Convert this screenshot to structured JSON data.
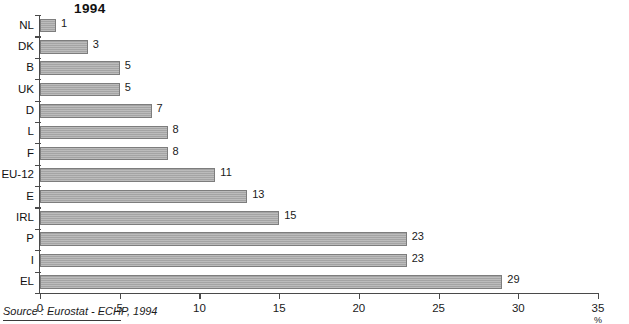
{
  "chart_data": {
    "type": "bar",
    "orientation": "horizontal",
    "title": "1994",
    "xlabel": "%",
    "ylabel": "",
    "xlim": [
      0,
      35
    ],
    "xticks": [
      0,
      5,
      10,
      15,
      20,
      25,
      30,
      35
    ],
    "grid": false,
    "legend": null,
    "categories": [
      "NL",
      "DK",
      "B",
      "UK",
      "D",
      "L",
      "F",
      "EU-12",
      "E",
      "IRL",
      "P",
      "I",
      "EL"
    ],
    "values": [
      1,
      3,
      5,
      5,
      7,
      8,
      8,
      11,
      13,
      15,
      23,
      23,
      29
    ],
    "data_labels": [
      "1",
      "3",
      "5",
      "5",
      "7",
      "8",
      "8",
      "11",
      "13",
      "15",
      "23",
      "23",
      "29"
    ],
    "source": "Source : Eurostat - ECHP, 1994",
    "bar_color": "#a9a9a9",
    "bar_border_color": "#7d7d7d",
    "axis_color": "#4a4a4a",
    "text_color": "#1a1a1a"
  },
  "figure": {
    "title": "1994",
    "unit_label": "%",
    "source_text": "Source : Eurostat - ECHP, 1994"
  }
}
